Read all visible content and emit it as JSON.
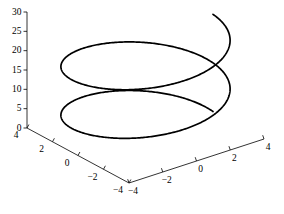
{
  "figure": {
    "width": 284,
    "height": 214,
    "background": "#ffffff",
    "title": ""
  },
  "chart_data": {
    "type": "line",
    "projection": "3d",
    "title": "",
    "grid": false,
    "legend": null,
    "axis_color": "#000000",
    "tick_label_color": "#000000",
    "series": [
      {
        "name": "helix",
        "color": "#000000",
        "line_width": 1.7,
        "parametric": {
          "x_expr": "4*cos(t)",
          "y_expr": "4*sin(t)",
          "z_expr": "2*t",
          "radius": 4,
          "z_rate": 2,
          "t_min": 0,
          "t_max": 12.566370614359172,
          "samples": 720
        }
      }
    ],
    "axes": {
      "x_bottom_right": {
        "label": "",
        "range": [
          -4,
          4
        ],
        "ticks": [
          -4,
          -2,
          0,
          2,
          4
        ],
        "tick_labels": [
          "−4",
          "−2",
          "0",
          "2",
          "4"
        ]
      },
      "y_bottom_left": {
        "label": "",
        "range": [
          -4,
          4
        ],
        "ticks": [
          4,
          2,
          0,
          -2,
          -4
        ],
        "tick_labels": [
          "4",
          "2",
          "0",
          "−2",
          "−4"
        ]
      },
      "z_vertical": {
        "label": "",
        "range": [
          0,
          30
        ],
        "ticks": [
          0,
          5,
          10,
          15,
          20,
          25,
          30
        ],
        "tick_labels": [
          "0",
          "5",
          "10",
          "15",
          "20",
          "25",
          "30"
        ]
      }
    }
  }
}
